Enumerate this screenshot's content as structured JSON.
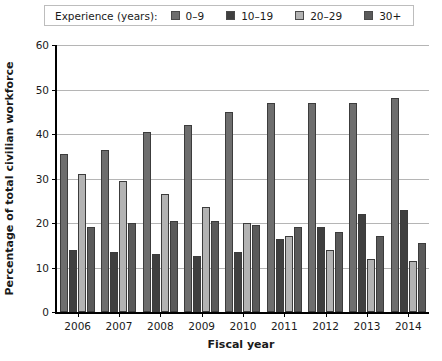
{
  "legend": {
    "title": "Experience (years):",
    "entries": [
      {
        "label": "0–9",
        "color": "#6e6e6e"
      },
      {
        "label": "10–19",
        "color": "#3f3f3f"
      },
      {
        "label": "20–29",
        "color": "#b3b3b3"
      },
      {
        "label": "30+",
        "color": "#5a5a5a"
      }
    ]
  },
  "axes": {
    "ylabel": "Percentage of total civilian workforce",
    "xlabel": "Fiscal year",
    "yticks": [
      "0",
      "10",
      "20",
      "30",
      "40",
      "50",
      "60"
    ]
  },
  "chart_data": {
    "type": "bar",
    "title": "",
    "xlabel": "Fiscal year",
    "ylabel": "Percentage of total civilian workforce",
    "categories": [
      "2006",
      "2007",
      "2008",
      "2009",
      "2010",
      "2011",
      "2012",
      "2013",
      "2014"
    ],
    "series": [
      {
        "name": "0–9",
        "color": "#6e6e6e",
        "values": [
          35.5,
          36.5,
          40.5,
          42.0,
          45.0,
          47.0,
          47.0,
          47.0,
          48.0
        ]
      },
      {
        "name": "10–19",
        "color": "#3f3f3f",
        "values": [
          14.0,
          13.5,
          13.0,
          12.5,
          13.5,
          16.5,
          19.0,
          22.0,
          23.0
        ]
      },
      {
        "name": "20–29",
        "color": "#b3b3b3",
        "values": [
          31.0,
          29.5,
          26.5,
          23.5,
          20.0,
          17.0,
          14.0,
          12.0,
          11.5
        ]
      },
      {
        "name": "30+",
        "color": "#5a5a5a",
        "values": [
          19.0,
          20.0,
          20.5,
          20.5,
          19.5,
          19.0,
          18.0,
          17.0,
          15.5
        ]
      }
    ],
    "ylim": [
      0,
      60
    ],
    "ytick_step": 10,
    "grid": true,
    "legend_position": "top"
  }
}
